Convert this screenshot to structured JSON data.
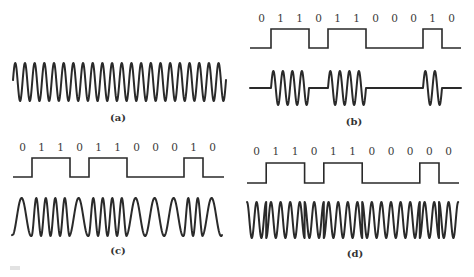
{
  "figure": {
    "panels": [
      {
        "id": "a",
        "label": "(a)",
        "type": "carrier",
        "description": "Unmodulated sinusoidal carrier",
        "cycles": 22,
        "x_start": 13,
        "x_end": 226,
        "center_y": 82,
        "amplitude": 19,
        "label_pos": [
          118,
          121
        ]
      },
      {
        "id": "b",
        "label": "(b)",
        "type": "ASK",
        "description": "Amplitude-shift keying",
        "bits": [
          "0",
          "1",
          "1",
          "0",
          "1",
          "1",
          "0",
          "0",
          "0",
          "1",
          "0"
        ],
        "bit_values": [
          0,
          1,
          1,
          0,
          1,
          1,
          0,
          0,
          0,
          1,
          0
        ],
        "x_start": 252,
        "bit_width": 19,
        "line_end": 461,
        "sq_high_y": 29,
        "sq_low_y": 48,
        "bits_label_y": 22,
        "wave_center_y": 88,
        "wave_amplitude": 17,
        "cycles_per_bit": 2,
        "label_pos": [
          354,
          125
        ]
      },
      {
        "id": "c",
        "label": "(c)",
        "type": "FSK",
        "description": "Frequency-shift keying",
        "bits": [
          "0",
          "1",
          "1",
          "0",
          "1",
          "1",
          "0",
          "0",
          "0",
          "1",
          "0"
        ],
        "bit_values": [
          0,
          1,
          1,
          0,
          1,
          1,
          0,
          0,
          0,
          1,
          0
        ],
        "x_start": 13,
        "bit_width": 19,
        "line_end": 224,
        "sq_high_y": 158,
        "sq_low_y": 177,
        "bits_label_y": 151,
        "wave_center_y": 217,
        "wave_amplitude": 19,
        "cycles_low": 1,
        "cycles_high": 2,
        "label_pos": [
          118,
          254
        ]
      },
      {
        "id": "d",
        "label": "(d)",
        "type": "PSK",
        "description": "Phase-shift keying",
        "bits": [
          "0",
          "1",
          "1",
          "0",
          "1",
          "1",
          "0",
          "0",
          "0",
          "0",
          "0"
        ],
        "bit_values": [
          0,
          1,
          1,
          0,
          1,
          1,
          0,
          0,
          0,
          1,
          0
        ],
        "x_start": 247,
        "bit_width": 19.2,
        "line_end": 459,
        "sq_high_y": 163,
        "sq_low_y": 183,
        "bits_label_y": 155,
        "wave_center_y": 220,
        "wave_amplitude": 18,
        "cycles_per_bit": 2,
        "label_pos": [
          355,
          257
        ]
      }
    ],
    "colors": {
      "ink": "#2a2a2a",
      "background": "#ffffff"
    }
  }
}
